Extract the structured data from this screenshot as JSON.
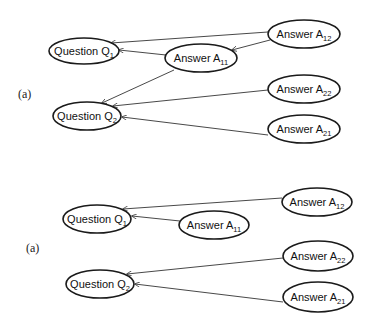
{
  "colors": {
    "stroke": "#1a1a1a",
    "edge": "#333333",
    "background": "#ffffff"
  },
  "panels": [
    {
      "label": "(a)",
      "label_pos": [
        18,
        98
      ],
      "nodes": [
        {
          "id": "Q1",
          "text": "Question Q",
          "sub": "1",
          "cx": 84,
          "cy": 51,
          "rx": 35,
          "ry": 13
        },
        {
          "id": "A11",
          "text": "Answer A",
          "sub": "11",
          "cx": 201,
          "cy": 58,
          "rx": 36,
          "ry": 14
        },
        {
          "id": "A12",
          "text": "Answer A",
          "sub": "12",
          "cx": 304,
          "cy": 34,
          "rx": 36,
          "ry": 14
        },
        {
          "id": "Q2",
          "text": "Question Q",
          "sub": "2",
          "cx": 87,
          "cy": 116,
          "rx": 34,
          "ry": 14
        },
        {
          "id": "A22",
          "text": "Answer A",
          "sub": "22",
          "cx": 304,
          "cy": 89,
          "rx": 36,
          "ry": 14
        },
        {
          "id": "A21",
          "text": "Answer A",
          "sub": "21",
          "cx": 304,
          "cy": 129,
          "rx": 36,
          "ry": 14
        }
      ],
      "edges": [
        {
          "from": "A12",
          "to": "Q1",
          "x1": 268,
          "y1": 32,
          "x2": 111,
          "y2": 43
        },
        {
          "from": "A11",
          "to": "Q1",
          "x1": 166,
          "y1": 55,
          "x2": 119,
          "y2": 50
        },
        {
          "from": "A12",
          "to": "A11",
          "x1": 270,
          "y1": 40,
          "x2": 232,
          "y2": 50
        },
        {
          "from": "A11",
          "to": "Q2",
          "x1": 174,
          "y1": 70,
          "x2": 102,
          "y2": 103
        },
        {
          "from": "A22",
          "to": "Q2",
          "x1": 268,
          "y1": 90,
          "x2": 113,
          "y2": 106
        },
        {
          "from": "A21",
          "to": "Q2",
          "x1": 268,
          "y1": 135,
          "x2": 122,
          "y2": 117
        }
      ]
    },
    {
      "label": "(a)",
      "label_pos": [
        26,
        252
      ],
      "nodes": [
        {
          "id": "Q1",
          "text": "Question Q",
          "sub": "1",
          "cx": 97,
          "cy": 219,
          "rx": 34,
          "ry": 14
        },
        {
          "id": "A11",
          "text": "Answer A",
          "sub": "11",
          "cx": 214,
          "cy": 225,
          "rx": 35,
          "ry": 14
        },
        {
          "id": "A12",
          "text": "Answer A",
          "sub": "12",
          "cx": 317,
          "cy": 202,
          "rx": 35,
          "ry": 14
        },
        {
          "id": "Q2",
          "text": "Question Q",
          "sub": "2",
          "cx": 100,
          "cy": 284,
          "rx": 34,
          "ry": 14
        },
        {
          "id": "A22",
          "text": "Answer A",
          "sub": "22",
          "cx": 318,
          "cy": 256,
          "rx": 35,
          "ry": 15
        },
        {
          "id": "A21",
          "text": "Answer A",
          "sub": "21",
          "cx": 318,
          "cy": 297,
          "rx": 35,
          "ry": 15
        }
      ],
      "edges": [
        {
          "from": "A12",
          "to": "Q1",
          "x1": 282,
          "y1": 198,
          "x2": 123,
          "y2": 209
        },
        {
          "from": "A11",
          "to": "Q1",
          "x1": 180,
          "y1": 221,
          "x2": 132,
          "y2": 216
        },
        {
          "from": "A22",
          "to": "Q2",
          "x1": 283,
          "y1": 258,
          "x2": 127,
          "y2": 274
        },
        {
          "from": "A21",
          "to": "Q2",
          "x1": 283,
          "y1": 302,
          "x2": 135,
          "y2": 284
        }
      ]
    }
  ]
}
